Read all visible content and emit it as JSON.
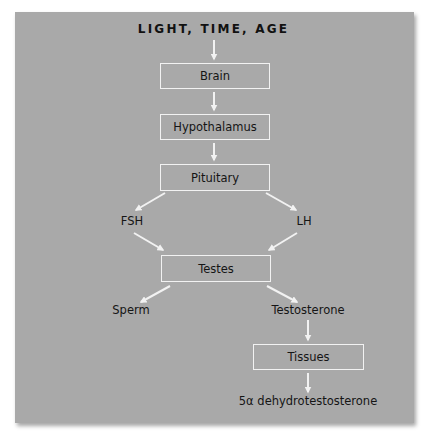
{
  "diagram": {
    "title": "LIGHT, TIME, AGE",
    "colors": {
      "panel_background": "#a9a9a9",
      "arrow_and_border": "#f2f2f2",
      "text": "#151515"
    },
    "nodes": {
      "brain": {
        "label": "Brain",
        "type": "box"
      },
      "hypothalamus": {
        "label": "Hypothalamus",
        "type": "box"
      },
      "pituitary": {
        "label": "Pituitary",
        "type": "box"
      },
      "fsh": {
        "label": "FSH",
        "type": "text"
      },
      "lh": {
        "label": "LH",
        "type": "text"
      },
      "testes": {
        "label": "Testes",
        "type": "box"
      },
      "sperm": {
        "label": "Sperm",
        "type": "text"
      },
      "testosterone": {
        "label": "Testosterone",
        "type": "text"
      },
      "tissues": {
        "label": "Tissues",
        "type": "box"
      },
      "dht": {
        "label": "5α dehydrotestosterone",
        "type": "text"
      }
    },
    "edges": [
      {
        "from": "title",
        "to": "brain"
      },
      {
        "from": "brain",
        "to": "hypothalamus"
      },
      {
        "from": "hypothalamus",
        "to": "pituitary"
      },
      {
        "from": "pituitary",
        "to": "fsh"
      },
      {
        "from": "pituitary",
        "to": "lh"
      },
      {
        "from": "fsh",
        "to": "testes"
      },
      {
        "from": "lh",
        "to": "testes"
      },
      {
        "from": "testes",
        "to": "sperm"
      },
      {
        "from": "testes",
        "to": "testosterone"
      },
      {
        "from": "testosterone",
        "to": "tissues"
      },
      {
        "from": "tissues",
        "to": "dht"
      }
    ]
  }
}
